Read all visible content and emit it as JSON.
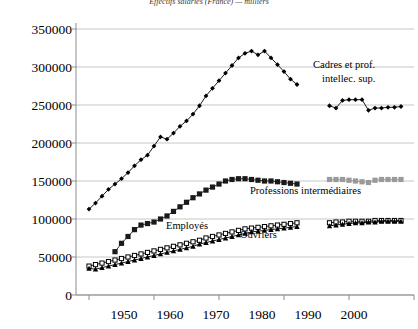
{
  "chart_data": {
    "type": "line",
    "title": "Effectifs salariés (France) — milliers",
    "xlabel": "",
    "ylabel": "",
    "xlim": [
      1948,
      2000
    ],
    "ylim": [
      0,
      350000
    ],
    "ytick_labels": [
      "350000",
      "300000",
      "250000",
      "200000",
      "150000",
      "100000",
      "50000",
      "0"
    ],
    "ytick_values": [
      350000,
      300000,
      250000,
      200000,
      150000,
      100000,
      50000,
      0
    ],
    "xtick_labels": [
      "1950",
      "1960",
      "1970",
      "1980",
      "1990",
      "2000"
    ],
    "xtick_values": [
      1950,
      1960,
      1970,
      1980,
      1990,
      2000
    ],
    "grid": true,
    "legend_position": "inline-annotations",
    "colors": {
      "cadres": "#000000",
      "professions_int": "#1a1a1a",
      "professions_int_late": "#9a9a9a",
      "employes": "#000000",
      "ouvriers": "#000000",
      "grid": "#b9b9b9",
      "axis": "#8d8d8d"
    },
    "annotations": [
      {
        "text": "Cadres et prof.",
        "x": 1991.5,
        "y": 288000
      },
      {
        "text": "intellec. sup.",
        "x": 1992.6,
        "y": 272000
      },
      {
        "text": "Professions intermédiaires",
        "x": 1989.0,
        "y": 133000
      },
      {
        "text": "Employés",
        "x": 1971.0,
        "y": 92000
      },
      {
        "text": "Ouvriers",
        "x": 1979.0,
        "y": 80000
      }
    ],
    "series": [
      {
        "name": "Cadres et prof. intellec. sup.",
        "marker": "diamond",
        "color": "#000000",
        "x": [
          1950,
          1951,
          1952,
          1953,
          1954,
          1955,
          1956,
          1957,
          1958,
          1959,
          1960,
          1961,
          1962,
          1963,
          1964,
          1965,
          1966,
          1967,
          1968,
          1969,
          1970,
          1971,
          1972,
          1973,
          1974,
          1975,
          1976,
          1977,
          1978,
          1979,
          1980,
          1981,
          1982,
          1987,
          1988,
          1989,
          1990,
          1991,
          1992,
          1993,
          1994,
          1995,
          1996,
          1997,
          1998
        ],
        "y": [
          113000,
          121000,
          130000,
          139000,
          146000,
          153000,
          161000,
          170000,
          178000,
          184000,
          196000,
          208000,
          205000,
          213000,
          222000,
          229000,
          238000,
          249000,
          262000,
          272000,
          282000,
          292000,
          302000,
          312000,
          318000,
          321000,
          316000,
          321000,
          312000,
          303000,
          294000,
          284000,
          277000,
          249000,
          246000,
          256000,
          257000,
          257000,
          257000,
          243000,
          246000,
          246000,
          247000,
          247000,
          248000
        ]
      },
      {
        "name": "Professions intermédiaires",
        "marker": "square",
        "color": "#1a1a1a",
        "x": [
          1954,
          1955,
          1956,
          1957,
          1958,
          1959,
          1960,
          1961,
          1962,
          1963,
          1964,
          1965,
          1966,
          1967,
          1968,
          1969,
          1970,
          1971,
          1972,
          1973,
          1974,
          1975,
          1976,
          1977,
          1978,
          1979,
          1980,
          1981,
          1982
        ],
        "y": [
          57000,
          68000,
          77000,
          86000,
          92000,
          94000,
          96000,
          100000,
          104000,
          110000,
          116000,
          122000,
          128000,
          133000,
          138000,
          142000,
          146000,
          150000,
          152000,
          153000,
          153000,
          152000,
          151000,
          150000,
          150000,
          149000,
          148000,
          147000,
          146000
        ]
      },
      {
        "name": "Professions intermédiaires (suite)",
        "marker": "square",
        "color": "#9a9a9a",
        "x": [
          1987,
          1988,
          1989,
          1990,
          1991,
          1992,
          1993,
          1994,
          1995,
          1996,
          1997,
          1998
        ],
        "y": [
          152000,
          152000,
          152000,
          151000,
          150000,
          149000,
          148000,
          151000,
          152000,
          152000,
          152000,
          152000
        ]
      },
      {
        "name": "Employés",
        "marker": "square-open",
        "color": "#000000",
        "x": [
          1950,
          1951,
          1952,
          1953,
          1954,
          1955,
          1956,
          1957,
          1958,
          1959,
          1960,
          1961,
          1962,
          1963,
          1964,
          1965,
          1966,
          1967,
          1968,
          1969,
          1970,
          1971,
          1972,
          1973,
          1974,
          1975,
          1976,
          1977,
          1978,
          1979,
          1980,
          1981,
          1982,
          1987,
          1988,
          1989,
          1990,
          1991,
          1992,
          1993,
          1994,
          1995,
          1996,
          1997,
          1998
        ],
        "y": [
          38000,
          40000,
          42000,
          44000,
          46000,
          48000,
          50000,
          52000,
          54000,
          56000,
          58000,
          60000,
          62000,
          64000,
          66000,
          68000,
          70000,
          72000,
          75000,
          77000,
          79000,
          81000,
          83000,
          85000,
          87000,
          88000,
          89000,
          90000,
          91000,
          92000,
          93000,
          94000,
          95000,
          95000,
          96000,
          96000,
          97000,
          97000,
          97000,
          97000,
          98000,
          98000,
          98000,
          98000,
          98000
        ]
      },
      {
        "name": "Ouvriers",
        "marker": "triangle",
        "color": "#000000",
        "x": [
          1950,
          1951,
          1952,
          1953,
          1954,
          1955,
          1956,
          1957,
          1958,
          1959,
          1960,
          1961,
          1962,
          1963,
          1964,
          1965,
          1966,
          1967,
          1968,
          1969,
          1970,
          1971,
          1972,
          1973,
          1974,
          1975,
          1976,
          1977,
          1978,
          1979,
          1980,
          1981,
          1982,
          1987,
          1988,
          1989,
          1990,
          1991,
          1992,
          1993,
          1994,
          1995,
          1996,
          1997,
          1998
        ],
        "y": [
          35000,
          34000,
          36000,
          38000,
          40000,
          42000,
          44000,
          46000,
          48000,
          50000,
          52000,
          54000,
          56000,
          58000,
          60000,
          62000,
          64000,
          67000,
          69000,
          71000,
          73000,
          75000,
          77000,
          79000,
          81000,
          83000,
          84000,
          85000,
          86000,
          87000,
          88000,
          89000,
          90000,
          91000,
          92000,
          93000,
          94000,
          95000,
          95000,
          96000,
          96000,
          97000,
          97000,
          97000,
          97000
        ]
      }
    ]
  }
}
